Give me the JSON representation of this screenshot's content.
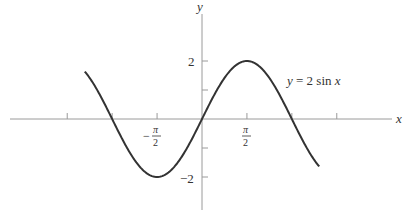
{
  "chart_data": {
    "type": "line",
    "title": "",
    "equation_label": "y = 2 sin x",
    "xlabel": "x",
    "ylabel": "y",
    "x_tick_labels": [
      "-π/2",
      "π/2"
    ],
    "x_ticks_unlabeled": [
      "-3π/2",
      "-π",
      "π",
      "3π/2"
    ],
    "y_tick_labels": [
      "2",
      "-2"
    ],
    "y_ticks_unlabeled": [
      "1",
      "-1"
    ],
    "xlim": [
      -4.15,
      4.25
    ],
    "ylim": [
      -2.6,
      2.6
    ],
    "grid": false,
    "series": [
      {
        "name": "y = 2 sin x",
        "function": "2*sin(x)",
        "x_range": [
          -4.1,
          4.1
        ],
        "key_points": [
          {
            "x": "-3π/2",
            "y": 2
          },
          {
            "x": "-π",
            "y": 0
          },
          {
            "x": "-π/2",
            "y": -2
          },
          {
            "x": "0",
            "y": 0
          },
          {
            "x": "π/2",
            "y": 2
          },
          {
            "x": "π",
            "y": 0
          },
          {
            "x": "3π/2",
            "y": -2
          }
        ]
      }
    ],
    "pixel_mapping": {
      "origin_x": 202,
      "origin_y": 119,
      "px_per_unit_x": 28.6,
      "px_per_unit_y": 29
    }
  },
  "labels": {
    "y_axis": "y",
    "x_axis": "x",
    "y_pos2": "2",
    "y_neg2": "−2",
    "pi": "π",
    "two": "2",
    "minus": "−",
    "equation": "y = 2 sin x"
  },
  "colors": {
    "curve": "#333333",
    "axis": "#9a9a9a",
    "text": "#333333"
  }
}
